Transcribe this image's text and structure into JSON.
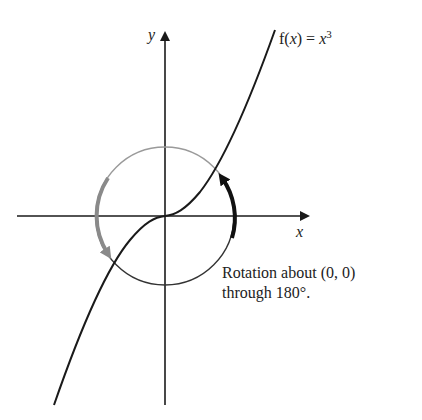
{
  "diagram": {
    "axes": {
      "x_label": "x",
      "y_label": "y"
    },
    "function_label": {
      "prefix": "f(",
      "var": "x",
      "middle": ") = ",
      "base": "x",
      "exponent": "3"
    },
    "caption": {
      "line1": "Rotation about (0, 0)",
      "line2": "through 180°."
    },
    "colors": {
      "curve": "#1a1a1a",
      "axes": "#1a1a1a",
      "circle_upper": "#9a9a9a",
      "circle_lower": "#333333",
      "arrow_gray": "#8a8a8a",
      "arrow_black": "#111111"
    }
  }
}
